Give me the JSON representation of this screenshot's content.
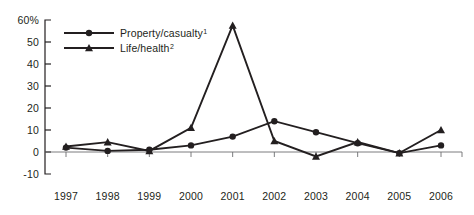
{
  "chart_data": {
    "type": "line",
    "title": "",
    "xlabel": "",
    "ylabel": "",
    "categories": [
      "1997",
      "1998",
      "1999",
      "2000",
      "2001",
      "2002",
      "2003",
      "2004",
      "2005",
      "2006"
    ],
    "ylim": [
      -10,
      60
    ],
    "yticks": [
      -10,
      0,
      10,
      20,
      30,
      40,
      50,
      60
    ],
    "ytick_labels": [
      "-10",
      "0",
      "10",
      "20",
      "30",
      "40",
      "50",
      "60%"
    ],
    "grid": false,
    "legend_position": "top-left",
    "series": [
      {
        "name": "Property/casualty",
        "footnote": "1",
        "marker": "circle",
        "values": [
          2,
          0.5,
          1,
          3,
          7,
          14,
          9,
          4,
          -0.5,
          3
        ]
      },
      {
        "name": "Life/health",
        "footnote": "2",
        "marker": "triangle",
        "values": [
          2.5,
          4.5,
          0.5,
          11,
          57.5,
          5,
          -2,
          4.5,
          -0.5,
          10
        ]
      }
    ]
  },
  "legend": {
    "items": [
      {
        "label": "Property/casualty",
        "sup": "1",
        "marker": "circle-marker-icon"
      },
      {
        "label": "Life/health",
        "sup": "2",
        "marker": "triangle-marker-icon"
      }
    ]
  },
  "colors": {
    "ink": "#231f20",
    "axis_gray": "#6d6e71",
    "background": "#ffffff"
  }
}
